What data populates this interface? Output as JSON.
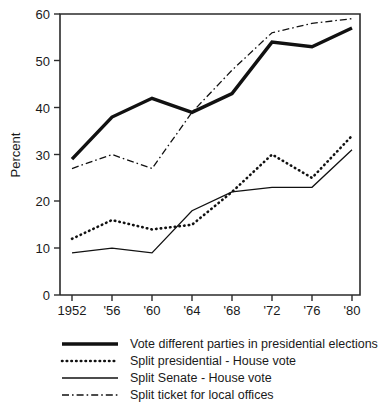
{
  "chart_data": {
    "type": "line",
    "title": "",
    "subtitle": "",
    "xlabel": "",
    "ylabel": "Percent",
    "x": [
      1952,
      1956,
      1960,
      1964,
      1968,
      1972,
      1976,
      1980
    ],
    "xtick_labels": [
      "1952",
      "'56",
      "'60",
      "'64",
      "'68",
      "'72",
      "'76",
      "'80"
    ],
    "ytick_labels": [
      "0",
      "10",
      "20",
      "30",
      "40",
      "50",
      "60"
    ],
    "ytick_values": [
      0,
      10,
      20,
      30,
      40,
      50,
      60
    ],
    "ylim": [
      0,
      60
    ],
    "xlim": [
      1950,
      1982
    ],
    "grid": false,
    "legend_position": "below",
    "series": [
      {
        "name": "Vote different parties in presidential elections",
        "style": "thick-solid",
        "color": "#111111",
        "values": [
          29,
          38,
          42,
          39,
          43,
          54,
          53,
          57
        ]
      },
      {
        "name": "Split presidential - House vote",
        "style": "dotted",
        "color": "#111111",
        "values": [
          12,
          16,
          14,
          15,
          22,
          30,
          25,
          34
        ]
      },
      {
        "name": "Split Senate - House vote",
        "style": "thin-solid",
        "color": "#111111",
        "values": [
          9,
          10,
          9,
          18,
          22,
          23,
          23,
          31
        ]
      },
      {
        "name": "Split ticket for local offices",
        "style": "dash-dot",
        "color": "#111111",
        "values": [
          27,
          30,
          27,
          39,
          48,
          56,
          58,
          59
        ]
      }
    ]
  },
  "legend": {
    "items": [
      {
        "label": "Vote different parties in presidential elections",
        "swatch": "thick-solid-swatch"
      },
      {
        "label": "Split presidential - House vote",
        "swatch": "dotted-swatch"
      },
      {
        "label": "Split Senate - House vote",
        "swatch": "thin-solid-swatch"
      },
      {
        "label": "Split ticket for local offices",
        "swatch": "dash-dot-swatch"
      }
    ]
  },
  "axes": {
    "y_title": "Percent"
  }
}
